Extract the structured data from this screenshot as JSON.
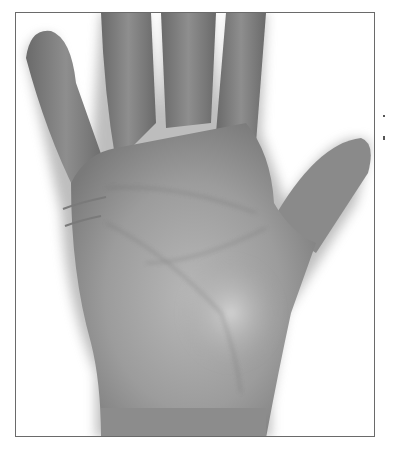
{
  "image": {
    "subject": "palm of a right hand, grayscale photograph",
    "annotations": [
      {
        "type": "drawn-line",
        "label": "upper line near index finger base",
        "color": "#7a7a7a"
      },
      {
        "type": "drawn-line",
        "label": "lower line near index finger base",
        "color": "#7a7a7a"
      }
    ],
    "colors": {
      "background": "#ffffff",
      "skin_dark": "#6e6e6e",
      "skin_mid": "#9a9a9a",
      "skin_light": "#c8c8c8",
      "frame_border": "#6a6a6a"
    }
  }
}
